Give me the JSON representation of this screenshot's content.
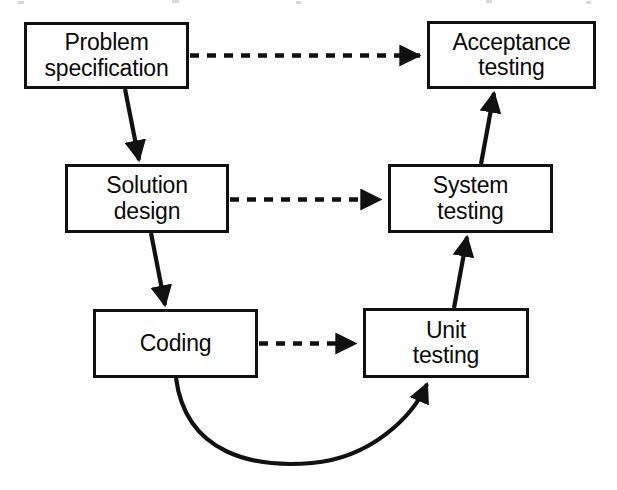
{
  "diagram": {
    "background_color": "#ffffff",
    "line_color": "#111111",
    "text_color": "#0a0a0a",
    "nodes": [
      {
        "id": "problem-specification",
        "label": "Problem\nspecification",
        "x": 24,
        "y": 22,
        "width": 165,
        "height": 67
      },
      {
        "id": "acceptance-testing",
        "label": "Acceptance\ntesting",
        "x": 427,
        "y": 21,
        "width": 169,
        "height": 68
      },
      {
        "id": "solution-design",
        "label": "Solution\ndesign",
        "x": 65,
        "y": 164,
        "width": 164,
        "height": 69
      },
      {
        "id": "system-testing",
        "label": "System\ntesting",
        "x": 388,
        "y": 164,
        "width": 165,
        "height": 69
      },
      {
        "id": "coding",
        "label": "Coding",
        "x": 93,
        "y": 309,
        "width": 165,
        "height": 69
      },
      {
        "id": "unit-testing",
        "label": "Unit\ntesting",
        "x": 363,
        "y": 308,
        "width": 166,
        "height": 70
      }
    ],
    "connectors": [
      {
        "id": "problem-to-acceptance",
        "from": "problem-specification",
        "to": "acceptance-testing",
        "style": "dashed",
        "direction": "horizontal-right"
      },
      {
        "id": "problem-to-solution",
        "from": "problem-specification",
        "to": "solution-design",
        "style": "solid",
        "direction": "diagonal-down-right"
      },
      {
        "id": "solution-to-system",
        "from": "solution-design",
        "to": "system-testing",
        "style": "dashed",
        "direction": "horizontal-right"
      },
      {
        "id": "solution-to-coding",
        "from": "solution-design",
        "to": "coding",
        "style": "solid",
        "direction": "diagonal-down-right"
      },
      {
        "id": "coding-to-unit",
        "from": "coding",
        "to": "unit-testing",
        "style": "dashed",
        "direction": "horizontal-right"
      },
      {
        "id": "coding-to-unit-curve",
        "from": "coding",
        "to": "unit-testing",
        "style": "solid-curved",
        "direction": "arc-below"
      },
      {
        "id": "unit-to-system",
        "from": "unit-testing",
        "to": "system-testing",
        "style": "solid",
        "direction": "diagonal-up-right"
      },
      {
        "id": "system-to-acceptance",
        "from": "system-testing",
        "to": "acceptance-testing",
        "style": "solid",
        "direction": "diagonal-up-right"
      }
    ]
  }
}
